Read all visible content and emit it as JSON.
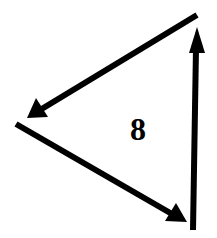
{
  "diagram": {
    "type": "triangle-of-arrows",
    "center_label": "8",
    "stroke_color": "#000000",
    "background_color": "#ffffff",
    "arrows": [
      {
        "id": "top-arrow",
        "from": [
          197,
          15
        ],
        "to": [
          27,
          118
        ],
        "direction": "down-left"
      },
      {
        "id": "bottom-arrow",
        "from": [
          16,
          124
        ],
        "to": [
          187,
          222
        ],
        "direction": "down-right"
      },
      {
        "id": "right-arrow",
        "from": [
          193,
          230
        ],
        "to": [
          197,
          27
        ],
        "direction": "up"
      }
    ]
  }
}
